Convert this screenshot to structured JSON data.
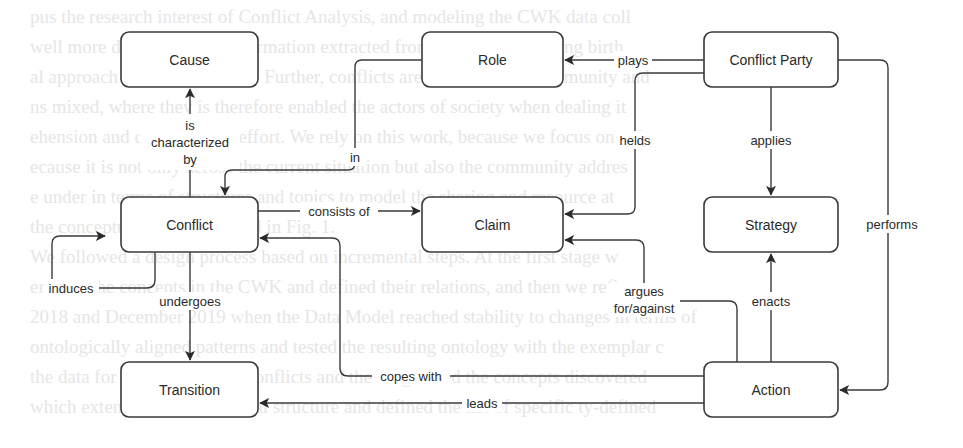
{
  "diagram": {
    "title": "",
    "nodes": {
      "cause": "Cause",
      "role": "Role",
      "conflict_party": "Conflict Party",
      "conflict": "Conflict",
      "claim": "Claim",
      "strategy": "Strategy",
      "transition": "Transition",
      "action": "Action"
    },
    "edges": [
      {
        "from": "Conflict",
        "to": "Cause",
        "label_lines": [
          "is",
          "characterized",
          "by"
        ]
      },
      {
        "from": "Conflict Party",
        "to": "Role",
        "label": "plays"
      },
      {
        "from": "Role",
        "to": "Conflict",
        "label": "in"
      },
      {
        "from": "Conflict Party",
        "to": "Claim",
        "label": "helds"
      },
      {
        "from": "Conflict Party",
        "to": "Strategy",
        "label": "applies"
      },
      {
        "from": "Conflict Party",
        "to": "Action",
        "label": "performs"
      },
      {
        "from": "Conflict",
        "to": "Claim",
        "label": "consists of"
      },
      {
        "from": "Conflict",
        "to": "Conflict",
        "label": "induces"
      },
      {
        "from": "Conflict",
        "to": "Transition",
        "label": "undergoes"
      },
      {
        "from": "Action",
        "to": "Claim",
        "label_lines": [
          "argues",
          "for/against"
        ]
      },
      {
        "from": "Action",
        "to": "Strategy",
        "label": "enacts"
      },
      {
        "from": "Action",
        "to": "Conflict",
        "label": "copes with"
      },
      {
        "from": "Action",
        "to": "Transition",
        "label": "leads"
      }
    ],
    "labels": {
      "characterized_1": "is",
      "characterized_2": "characterized",
      "characterized_3": "by",
      "plays": "plays",
      "in": "in",
      "helds": "helds",
      "applies": "applies",
      "performs": "performs",
      "consists_of": "consists of",
      "induces": "induces",
      "undergoes": "undergoes",
      "argues_1": "argues",
      "argues_2": "for/against",
      "enacts": "enacts",
      "copes_with": "copes with",
      "leads": "leads"
    }
  },
  "background_text": [
    "pus the research interest of Conflict Analysis, and modeling the CWK data coll",
    "well more directly on the information extracted from the conflicts giving birth",
    "al approach and with answers. Further, conflicts are related to the community and",
    "ns mixed, where they is therefore enabled the actors of society when dealing it",
    "ehension and collaborative effort. We rely on this work, because we focus on only",
    "ecause it is not only across the current situation but also the community addres",
    "e under in terms of structures and topics to model the sharing and resource at",
    "the conceptual model depicted in Fig. 1.",
    "We followed a design process based on incremental steps. At the first stage w",
    "ered all the concepts in the CWK and defined their relations, and then we refine",
    "2018 and December 2019 when the Data Model reached stability to changes in terms of",
    "ontologically aligned patterns and tested the resulting ontology with the exemplar c",
    "the data for the modeling of conflicts and then organized the concepts discovered",
    "which extended the ontological structure and defined the list of specific ty-defined"
  ]
}
